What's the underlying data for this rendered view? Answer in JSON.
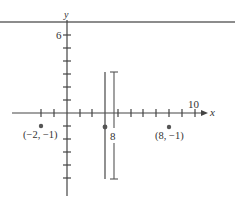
{
  "diagram": {
    "type": "coordinate-plane",
    "colors": {
      "axis": "#444444",
      "top_rule": "#666666",
      "line": "#555555",
      "point": "#555555",
      "text": "#333333"
    },
    "axes": {
      "x_label": "x",
      "y_label": "y",
      "x_tick_label": "10",
      "y_tick_label": "6",
      "x_range": [
        -4,
        10.5
      ],
      "y_range": [
        -6.5,
        7
      ]
    },
    "points": [
      {
        "id": "p1",
        "x": -2,
        "y": -1,
        "label": "(−2, −1)"
      },
      {
        "id": "p2",
        "x": 8,
        "y": -1,
        "label": "(8, −1)"
      },
      {
        "id": "p3",
        "x": 3,
        "y": -1,
        "label": ""
      }
    ],
    "vertical_line": {
      "x": 3,
      "y_top": 3,
      "y_bottom": -5
    },
    "measurement": {
      "label": "8",
      "y_top": 3,
      "y_bottom": -5
    }
  }
}
